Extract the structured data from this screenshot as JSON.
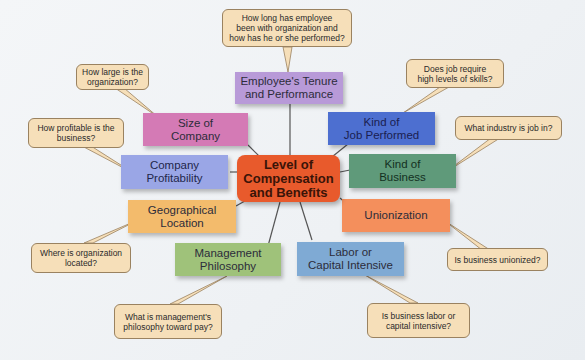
{
  "diagram": {
    "center": {
      "label": "Level of\nCompensation\nand Benefits",
      "color": "#e85a2c"
    },
    "factors": [
      {
        "id": "tenure",
        "label": "Employee's Tenure\nand Performance",
        "color": "#b89ad8",
        "question": "How long has employee\nbeen with organization and\nhow has he or she performed?"
      },
      {
        "id": "size",
        "label": "Size of\nCompany",
        "color": "#d47ab5",
        "question": "How large is the\norganization?"
      },
      {
        "id": "job",
        "label": "Kind of\nJob Performed",
        "color": "#4d6fd0",
        "question": "Does job require\nhigh levels of skills?"
      },
      {
        "id": "profit",
        "label": "Company\nProfitability",
        "color": "#9aa6e6",
        "question": "How profitable is the\nbusiness?"
      },
      {
        "id": "business",
        "label": "Kind of\nBusiness",
        "color": "#5f9a7a",
        "question": "What industry is job in?"
      },
      {
        "id": "geo",
        "label": "Geographical\nLocation",
        "color": "#f3bb6c",
        "question": "Where is organization\nlocated?"
      },
      {
        "id": "union",
        "label": "Unionization",
        "color": "#f48f5c",
        "question": "Is business unionized?"
      },
      {
        "id": "mgmt",
        "label": "Management\nPhilosophy",
        "color": "#9fc27a",
        "question": "What is management's\nphilosophy toward pay?"
      },
      {
        "id": "labor",
        "label": "Labor or\nCapital Intensive",
        "color": "#7faad4",
        "question": "Is business labor or\ncapital intensive?"
      }
    ]
  }
}
